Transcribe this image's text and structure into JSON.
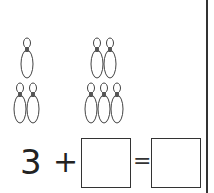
{
  "worksheet": {
    "left_group": {
      "pin_count": 3,
      "layout": "1 top, 2 bottom"
    },
    "right_group": {
      "pin_count": 5,
      "layout": "2 top, 3 bottom"
    },
    "equation": {
      "first_addend": "3",
      "operator": "+",
      "second_addend_box": "",
      "equals": "=",
      "result_box": ""
    }
  },
  "colors": {
    "line": "#333333",
    "pin_neck": "#555555"
  }
}
